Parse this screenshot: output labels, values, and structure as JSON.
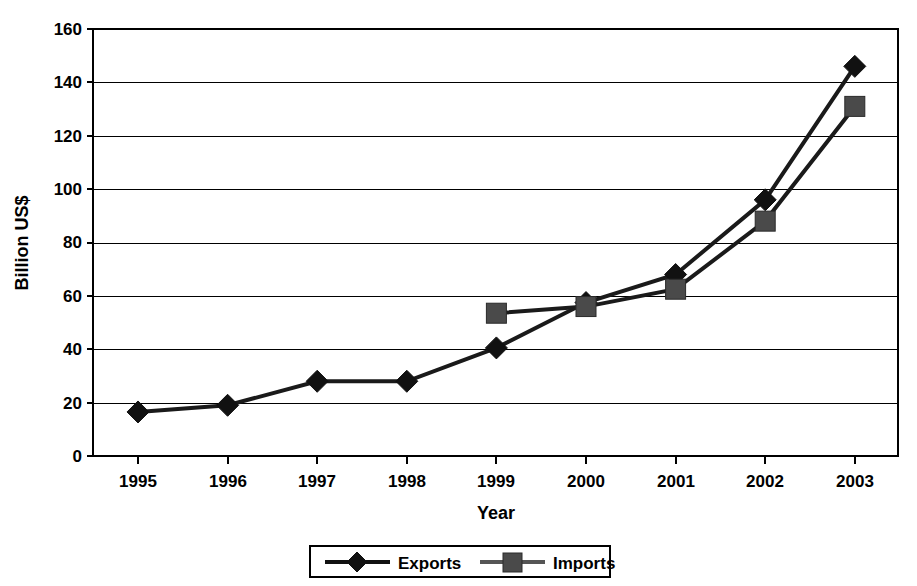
{
  "chart_data": {
    "type": "line",
    "title": "",
    "xlabel": "Year",
    "ylabel": "Billion US$",
    "categories": [
      "1995",
      "1996",
      "1997",
      "1998",
      "1999",
      "2000",
      "2001",
      "2002",
      "2003"
    ],
    "series": [
      {
        "name": "Exports",
        "marker": "diamond",
        "color": "#111111",
        "values": [
          16.5,
          19,
          28,
          28,
          40.5,
          57.5,
          68,
          96,
          146
        ]
      },
      {
        "name": "Imports",
        "marker": "square",
        "color": "#4a4a4a",
        "values": [
          null,
          null,
          null,
          null,
          53.5,
          56,
          62.5,
          88,
          131
        ]
      }
    ],
    "ylim": [
      0,
      160
    ],
    "ytick_step": 20,
    "yticks": [
      "0",
      "20",
      "40",
      "60",
      "80",
      "100",
      "120",
      "140",
      "160"
    ],
    "grid": "horizontal",
    "legend_position": "bottom",
    "legend_entries": [
      "Exports",
      "Imports"
    ]
  }
}
